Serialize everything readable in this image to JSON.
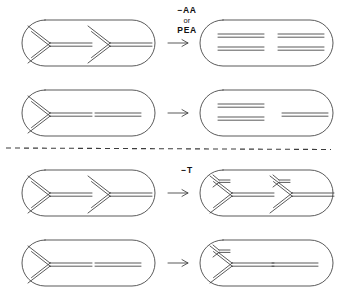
{
  "figure": {
    "background_color": "#ffffff",
    "ink_color": "#3c3c3c",
    "divider": {
      "style": "dashed",
      "y": 148,
      "name": "panel-divider"
    },
    "labels": {
      "treatment_top_line1": "−AA",
      "treatment_top_line2": "or",
      "treatment_top_line3": "PEA",
      "treatment_bottom": "−T",
      "arrow_glyph": "→"
    },
    "rows": [
      {
        "id": "row-1",
        "panel": "top",
        "treatment": "−AA or PEA",
        "before": {
          "name": "cell-before-row-1",
          "description": "cell with two replication forks",
          "elements": [
            {
              "type": "fork",
              "x": 30,
              "branched": false
            },
            {
              "type": "fork",
              "x": 90,
              "branched": false
            }
          ]
        },
        "after": {
          "name": "cell-after-row-1",
          "description": "cell with two pairs of completed duplexes",
          "elements": [
            {
              "type": "duplex-group",
              "x": 18,
              "count": 2
            },
            {
              "type": "duplex-group",
              "x": 78,
              "count": 2
            }
          ]
        }
      },
      {
        "id": "row-2",
        "panel": "top",
        "treatment": "−AA or PEA",
        "before": {
          "name": "cell-before-row-2",
          "description": "cell with one replication fork and one completed duplex",
          "elements": [
            {
              "type": "fork",
              "x": 30,
              "branched": false
            },
            {
              "type": "duplex",
              "x": 95
            }
          ]
        },
        "after": {
          "name": "cell-after-row-2",
          "description": "cell with two completed duplexes and one single duplex",
          "elements": [
            {
              "type": "duplex-group",
              "x": 18,
              "count": 2
            },
            {
              "type": "duplex",
              "x": 82
            }
          ]
        }
      },
      {
        "id": "row-3",
        "panel": "bottom",
        "treatment": "−T",
        "before": {
          "name": "cell-before-row-3",
          "description": "cell with two replication forks",
          "elements": [
            {
              "type": "fork",
              "x": 30,
              "branched": false
            },
            {
              "type": "fork",
              "x": 90,
              "branched": false
            }
          ]
        },
        "after": {
          "name": "cell-after-row-3",
          "description": "cell with two replication forks each bearing a new secondary initiation branch",
          "elements": [
            {
              "type": "fork",
              "x": 30,
              "branched": true
            },
            {
              "type": "fork",
              "x": 90,
              "branched": true
            }
          ]
        }
      },
      {
        "id": "row-4",
        "panel": "bottom",
        "treatment": "−T",
        "before": {
          "name": "cell-before-row-4",
          "description": "cell with one replication fork and one completed duplex",
          "elements": [
            {
              "type": "fork",
              "x": 30,
              "branched": false
            },
            {
              "type": "duplex",
              "x": 95
            }
          ]
        },
        "after": {
          "name": "cell-after-row-4",
          "description": "cell with one branched replication fork and one completed duplex",
          "elements": [
            {
              "type": "fork",
              "x": 30,
              "branched": true
            },
            {
              "type": "duplex",
              "x": 95
            }
          ]
        }
      }
    ]
  }
}
